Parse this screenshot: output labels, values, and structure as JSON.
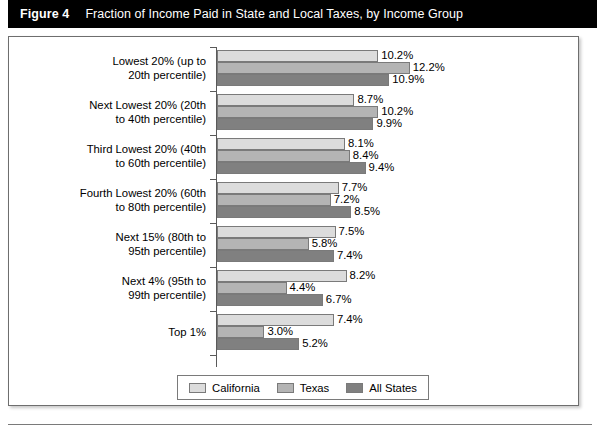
{
  "header": {
    "figure_number": "Figure 4",
    "title": "Fraction of Income Paid in State and Local Taxes, by Income Group"
  },
  "legend": {
    "items": [
      {
        "label": "California",
        "color": "#dcdcdc",
        "swatch_name": "legend-swatch-california"
      },
      {
        "label": "Texas",
        "color": "#b4b4b4",
        "swatch_name": "legend-swatch-texas"
      },
      {
        "label": "All States",
        "color": "#808080",
        "swatch_name": "legend-swatch-all-states"
      }
    ]
  },
  "chart_data": {
    "type": "bar",
    "orientation": "horizontal",
    "title": "Fraction of Income Paid in State and Local Taxes, by Income Group",
    "xlabel": "",
    "ylabel": "",
    "xlim": [
      0,
      12.8
    ],
    "grid": false,
    "legend_position": "bottom",
    "value_suffix": "%",
    "categories": [
      "Lowest 20% (up to 20th percentile)",
      "Next Lowest 20% (20th to 40th percentile)",
      "Third Lowest 20% (40th to 60th percentile)",
      "Fourth Lowest 20% (60th to 80th percentile)",
      "Next 15% (80th to 95th percentile)",
      "Next 4% (95th to 99th percentile)",
      "Top 1%"
    ],
    "category_lines": [
      [
        "Lowest 20% (up to",
        "20th percentile)"
      ],
      [
        "Next Lowest 20% (20th",
        "to 40th percentile)"
      ],
      [
        "Third Lowest 20% (40th",
        "to 60th percentile)"
      ],
      [
        "Fourth Lowest 20% (60th",
        "to 80th percentile)"
      ],
      [
        "Next 15% (80th to",
        "95th percentile)"
      ],
      [
        "Next 4% (95th to",
        "99th percentile)"
      ],
      [
        "Top 1%"
      ]
    ],
    "series": [
      {
        "name": "California",
        "color": "#dcdcdc",
        "values": [
          10.2,
          8.7,
          8.1,
          7.7,
          7.5,
          8.2,
          7.4
        ],
        "labels": [
          "10.2%",
          "8.7%",
          "8.1%",
          "7.7%",
          "7.5%",
          "8.2%",
          "7.4%"
        ]
      },
      {
        "name": "Texas",
        "color": "#b4b4b4",
        "values": [
          12.2,
          10.2,
          8.4,
          7.2,
          5.8,
          4.4,
          3.0
        ],
        "labels": [
          "12.2%",
          "10.2%",
          "8.4%",
          "7.2%",
          "5.8%",
          "4.4%",
          "3.0%"
        ]
      },
      {
        "name": "All States",
        "color": "#808080",
        "values": [
          10.9,
          9.9,
          9.4,
          8.5,
          7.4,
          6.7,
          5.2
        ],
        "labels": [
          "10.9%",
          "9.9%",
          "9.4%",
          "8.5%",
          "7.4%",
          "6.7%",
          "5.2%"
        ]
      }
    ]
  }
}
